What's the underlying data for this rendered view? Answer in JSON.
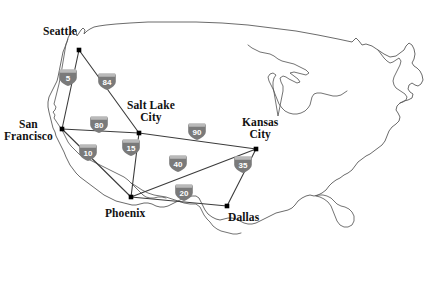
{
  "map": {
    "title": "United States Interstate Highway Network",
    "width": 448,
    "height": 283,
    "background_color": "#ffffff",
    "outline_color": "#4a4a4a",
    "edge_color": "#3c3c3c",
    "node_color": "#000000",
    "shield_color": "#7a7a7a",
    "shield_band_color": "#b9b9b9",
    "label_color": "#111111"
  },
  "cities": [
    {
      "id": "seattle",
      "name": "Seattle",
      "lines": [
        "Seattle"
      ],
      "x": 79,
      "y": 50,
      "label_x": 43,
      "label_y": 25
    },
    {
      "id": "san-francisco",
      "name": "San Francisco",
      "lines": [
        "San",
        "Francisco"
      ],
      "x": 62,
      "y": 129,
      "label_x": 4,
      "label_y": 118
    },
    {
      "id": "salt-lake-city",
      "name": "Salt Lake City",
      "lines": [
        "Salt Lake",
        "City"
      ],
      "x": 139,
      "y": 133,
      "label_x": 127,
      "label_y": 99
    },
    {
      "id": "kansas-city",
      "name": "Kansas City",
      "lines": [
        "Kansas",
        "City"
      ],
      "x": 256,
      "y": 149,
      "label_x": 242,
      "label_y": 116
    },
    {
      "id": "phoenix",
      "name": "Phoenix",
      "lines": [
        "Phoenix"
      ],
      "x": 131,
      "y": 197,
      "label_x": 105,
      "label_y": 207
    },
    {
      "id": "dallas",
      "name": "Dallas",
      "lines": [
        "Dallas"
      ],
      "x": 227,
      "y": 206,
      "label_x": 228,
      "label_y": 211
    }
  ],
  "routes": [
    {
      "id": "i5",
      "shield_label": "5",
      "from": "seattle",
      "to": "san-francisco",
      "shield_x": 68,
      "shield_y": 77
    },
    {
      "id": "i84",
      "shield_label": "84",
      "from": "seattle",
      "to": "salt-lake-city",
      "shield_x": 107,
      "shield_y": 81
    },
    {
      "id": "i80",
      "shield_label": "80",
      "from": "san-francisco",
      "to": "salt-lake-city",
      "shield_x": 99,
      "shield_y": 124
    },
    {
      "id": "i10",
      "shield_label": "10",
      "from": "san-francisco",
      "to": "phoenix",
      "shield_x": 88,
      "shield_y": 152
    },
    {
      "id": "i15",
      "shield_label": "15",
      "from": "salt-lake-city",
      "to": "phoenix",
      "shield_x": 131,
      "shield_y": 147
    },
    {
      "id": "i90",
      "shield_label": "90",
      "from": "salt-lake-city",
      "to": "kansas-city",
      "shield_x": 197,
      "shield_y": 131
    },
    {
      "id": "i40",
      "shield_label": "40",
      "from": "phoenix",
      "to": "kansas-city",
      "shield_x": 178,
      "shield_y": 163
    },
    {
      "id": "i35",
      "shield_label": "35",
      "from": "kansas-city",
      "to": "dallas",
      "shield_x": 243,
      "shield_y": 164
    },
    {
      "id": "i20",
      "shield_label": "20",
      "from": "phoenix",
      "to": "dallas",
      "shield_x": 184,
      "shield_y": 192
    }
  ]
}
